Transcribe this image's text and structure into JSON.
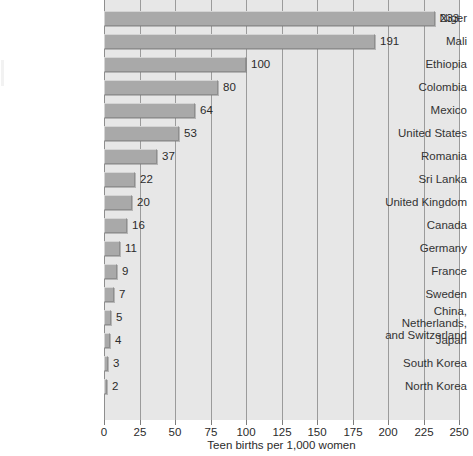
{
  "chart_data": {
    "type": "bar",
    "orientation": "horizontal",
    "title": "",
    "subtitle": "",
    "xlabel": "Teen births per 1,000 women",
    "ylabel": "",
    "xlim": [
      0,
      250
    ],
    "xticks": [
      0,
      25,
      50,
      75,
      100,
      125,
      150,
      175,
      200,
      225,
      250
    ],
    "xtick_labels": [
      "0",
      "25",
      "50",
      "75",
      "100",
      "125",
      "150",
      "175",
      "200",
      "225",
      "250"
    ],
    "grid": true,
    "legend": null,
    "categories": [
      "Niger",
      "Mali",
      "Ethiopia",
      "Colombia",
      "Mexico",
      "United States",
      "Romania",
      "Sri Lanka",
      "United Kingdom",
      "Canada",
      "Germany",
      "France",
      "Sweden",
      "China, Netherlands,\nand Switzerland",
      "Japan",
      "South Korea",
      "North Korea"
    ],
    "values": [
      233,
      191,
      100,
      80,
      64,
      53,
      37,
      22,
      20,
      16,
      11,
      9,
      7,
      5,
      4,
      3,
      2
    ],
    "data_labels": [
      "233",
      "191",
      "100",
      "80",
      "64",
      "53",
      "37",
      "22",
      "20",
      "16",
      "11",
      "9",
      "7",
      "5",
      "4",
      "3",
      "2"
    ],
    "colors": {
      "bar_fill": "#a9a9a9",
      "bar_highlight": "#d4d4d4",
      "bar_shadow": "#8e8e8e",
      "plot_background": "#e7e7e7",
      "gridline": "#9b9b9b",
      "text": "#333333",
      "page_background": "#ffffff"
    }
  }
}
